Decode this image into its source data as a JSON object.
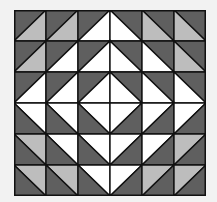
{
  "grid": {
    "rows": 6,
    "cols": 6
  },
  "colors": {
    "dark": "#5f5f5f",
    "light": "#bdbdbd",
    "white": "#ffffff",
    "line": "#111111",
    "background": "#f2f2f2"
  },
  "cells": [
    [
      {
        "d": "/",
        "a": "dark",
        "b": "light"
      },
      {
        "d": "/",
        "a": "dark",
        "b": "light"
      },
      {
        "d": "/",
        "a": "dark",
        "b": "white"
      },
      {
        "d": "\\",
        "a": "dark",
        "b": "white"
      },
      {
        "d": "\\",
        "a": "dark",
        "b": "light"
      },
      {
        "d": "\\",
        "a": "dark",
        "b": "light"
      }
    ],
    [
      {
        "d": "/",
        "a": "dark",
        "b": "light"
      },
      {
        "d": "/",
        "a": "dark",
        "b": "white"
      },
      {
        "d": "/",
        "a": "dark",
        "b": "white"
      },
      {
        "d": "\\",
        "a": "dark",
        "b": "white"
      },
      {
        "d": "\\",
        "a": "dark",
        "b": "white"
      },
      {
        "d": "\\",
        "a": "dark",
        "b": "light"
      }
    ],
    [
      {
        "d": "/",
        "a": "dark",
        "b": "white"
      },
      {
        "d": "/",
        "a": "dark",
        "b": "white"
      },
      {
        "d": "/",
        "a": "dark",
        "b": "white"
      },
      {
        "d": "\\",
        "a": "dark",
        "b": "white"
      },
      {
        "d": "\\",
        "a": "dark",
        "b": "white"
      },
      {
        "d": "\\",
        "a": "dark",
        "b": "white"
      }
    ],
    [
      {
        "d": "\\",
        "a": "white",
        "b": "dark"
      },
      {
        "d": "\\",
        "a": "white",
        "b": "dark"
      },
      {
        "d": "\\",
        "a": "white",
        "b": "dark"
      },
      {
        "d": "/",
        "a": "white",
        "b": "dark"
      },
      {
        "d": "/",
        "a": "white",
        "b": "dark"
      },
      {
        "d": "/",
        "a": "white",
        "b": "dark"
      }
    ],
    [
      {
        "d": "\\",
        "a": "light",
        "b": "dark"
      },
      {
        "d": "\\",
        "a": "white",
        "b": "dark"
      },
      {
        "d": "\\",
        "a": "white",
        "b": "dark"
      },
      {
        "d": "/",
        "a": "white",
        "b": "dark"
      },
      {
        "d": "/",
        "a": "white",
        "b": "dark"
      },
      {
        "d": "/",
        "a": "light",
        "b": "dark"
      }
    ],
    [
      {
        "d": "\\",
        "a": "light",
        "b": "dark"
      },
      {
        "d": "\\",
        "a": "light",
        "b": "dark"
      },
      {
        "d": "\\",
        "a": "white",
        "b": "dark"
      },
      {
        "d": "/",
        "a": "white",
        "b": "dark"
      },
      {
        "d": "/",
        "a": "light",
        "b": "dark"
      },
      {
        "d": "/",
        "a": "light",
        "b": "dark"
      }
    ]
  ]
}
